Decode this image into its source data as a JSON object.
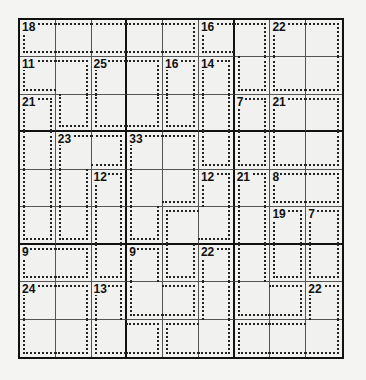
{
  "puzzle": {
    "type": "killer-sudoku",
    "size": 9,
    "cages": [
      {
        "sum": 18,
        "cells": [
          [
            0,
            0
          ],
          [
            0,
            1
          ],
          [
            0,
            2
          ],
          [
            0,
            3
          ],
          [
            0,
            4
          ]
        ]
      },
      {
        "sum": 16,
        "cells": [
          [
            0,
            5
          ],
          [
            0,
            6
          ],
          [
            1,
            6
          ]
        ]
      },
      {
        "sum": 22,
        "cells": [
          [
            0,
            7
          ],
          [
            0,
            8
          ],
          [
            1,
            7
          ],
          [
            1,
            8
          ]
        ]
      },
      {
        "sum": 11,
        "cells": [
          [
            1,
            0
          ],
          [
            1,
            1
          ],
          [
            2,
            1
          ]
        ]
      },
      {
        "sum": 25,
        "cells": [
          [
            1,
            2
          ],
          [
            1,
            3
          ],
          [
            2,
            2
          ],
          [
            2,
            3
          ]
        ]
      },
      {
        "sum": 16,
        "cells": [
          [
            1,
            4
          ],
          [
            2,
            4
          ]
        ]
      },
      {
        "sum": 14,
        "cells": [
          [
            1,
            5
          ],
          [
            2,
            5
          ],
          [
            3,
            5
          ]
        ]
      },
      {
        "sum": 21,
        "cells": [
          [
            2,
            0
          ],
          [
            3,
            0
          ],
          [
            4,
            0
          ],
          [
            5,
            0
          ]
        ]
      },
      {
        "sum": 7,
        "cells": [
          [
            2,
            6
          ],
          [
            3,
            6
          ]
        ]
      },
      {
        "sum": 21,
        "cells": [
          [
            2,
            7
          ],
          [
            2,
            8
          ],
          [
            3,
            7
          ],
          [
            3,
            8
          ]
        ]
      },
      {
        "sum": 23,
        "cells": [
          [
            3,
            1
          ],
          [
            3,
            2
          ],
          [
            4,
            1
          ],
          [
            5,
            1
          ]
        ]
      },
      {
        "sum": 33,
        "cells": [
          [
            3,
            3
          ],
          [
            3,
            4
          ],
          [
            4,
            3
          ],
          [
            4,
            4
          ],
          [
            5,
            3
          ]
        ]
      },
      {
        "sum": 12,
        "cells": [
          [
            4,
            2
          ],
          [
            5,
            2
          ],
          [
            6,
            2
          ]
        ]
      },
      {
        "sum": 12,
        "cells": [
          [
            4,
            5
          ],
          [
            5,
            5
          ],
          [
            5,
            4
          ],
          [
            6,
            4
          ]
        ]
      },
      {
        "sum": 21,
        "cells": [
          [
            4,
            6
          ],
          [
            5,
            6
          ],
          [
            6,
            6
          ],
          [
            7,
            6
          ],
          [
            7,
            7
          ]
        ]
      },
      {
        "sum": 8,
        "cells": [
          [
            4,
            7
          ],
          [
            4,
            8
          ]
        ]
      },
      {
        "sum": 19,
        "cells": [
          [
            5,
            7
          ],
          [
            6,
            7
          ]
        ]
      },
      {
        "sum": 7,
        "cells": [
          [
            5,
            8
          ],
          [
            6,
            8
          ]
        ]
      },
      {
        "sum": 9,
        "cells": [
          [
            6,
            0
          ],
          [
            6,
            1
          ]
        ]
      },
      {
        "sum": 9,
        "cells": [
          [
            6,
            3
          ],
          [
            7,
            3
          ],
          [
            7,
            4
          ]
        ]
      },
      {
        "sum": 22,
        "cells": [
          [
            6,
            5
          ],
          [
            7,
            5
          ],
          [
            8,
            5
          ],
          [
            8,
            4
          ]
        ]
      },
      {
        "sum": 24,
        "cells": [
          [
            7,
            0
          ],
          [
            7,
            1
          ],
          [
            8,
            0
          ],
          [
            8,
            1
          ]
        ]
      },
      {
        "sum": 13,
        "cells": [
          [
            7,
            2
          ],
          [
            8,
            2
          ],
          [
            8,
            3
          ]
        ]
      },
      {
        "sum": 22,
        "cells": [
          [
            7,
            8
          ],
          [
            8,
            6
          ],
          [
            8,
            7
          ],
          [
            8,
            8
          ]
        ]
      }
    ]
  }
}
